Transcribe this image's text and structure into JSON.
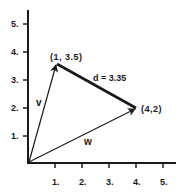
{
  "diagram": {
    "title": "",
    "colors": {
      "ink": "#1a1a1a",
      "background": "#ffffff"
    },
    "axes": {
      "x_ticks": [
        "1.",
        "2.",
        "3.",
        "4.",
        "5."
      ],
      "y_ticks": [
        "1.",
        "2.",
        "3.",
        "4.",
        "5."
      ]
    },
    "points": {
      "p1": {
        "label": "(1, 3.5)",
        "x": 1,
        "y": 3.5
      },
      "p2": {
        "label": "(4,2)",
        "x": 4,
        "y": 2
      }
    },
    "vectors": {
      "v": {
        "label": "v",
        "from": [
          0,
          0
        ],
        "to": [
          1,
          3.5
        ]
      },
      "w": {
        "label": "w",
        "from": [
          0,
          0
        ],
        "to": [
          4,
          2
        ]
      }
    },
    "distance": {
      "label": "d = 3.35",
      "value": 3.35
    }
  }
}
